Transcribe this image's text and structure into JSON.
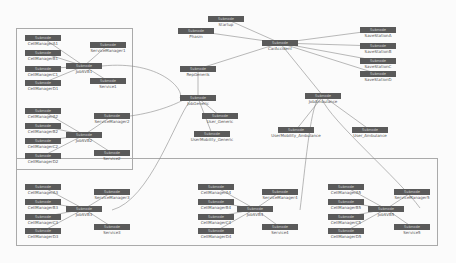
{
  "diagram": {
    "type_label": "Subnode",
    "nodes": [
      {
        "id": "phasm",
        "label": "Phasm",
        "x": 178,
        "y": 28,
        "w": 36
      },
      {
        "id": "startup",
        "label": "Startup",
        "x": 208,
        "y": 16,
        "w": 36
      },
      {
        "id": "caraccident",
        "label": "CarAccident",
        "x": 262,
        "y": 40,
        "w": 36
      },
      {
        "id": "ss_a",
        "label": "SaveStationA",
        "x": 360,
        "y": 27,
        "w": 36
      },
      {
        "id": "ss_b",
        "label": "SaveStationB",
        "x": 360,
        "y": 43,
        "w": 36
      },
      {
        "id": "ss_c",
        "label": "SaveStationC",
        "x": 360,
        "y": 58,
        "w": 36
      },
      {
        "id": "ss_d",
        "label": "SaveStationD",
        "x": 360,
        "y": 71,
        "w": 36
      },
      {
        "id": "repgenerisch",
        "label": "RepGenerik",
        "x": 180,
        "y": 66,
        "w": 36
      },
      {
        "id": "jobgeneric",
        "label": "JobGeneric",
        "x": 180,
        "y": 95,
        "w": 36
      },
      {
        "id": "user_generic",
        "label": "User_Generic",
        "x": 202,
        "y": 113,
        "w": 36
      },
      {
        "id": "usermob_generic",
        "label": "UserMobility_Generic",
        "x": 194,
        "y": 131,
        "w": 36
      },
      {
        "id": "jobambulance",
        "label": "JobAmbulance",
        "x": 305,
        "y": 93,
        "w": 36
      },
      {
        "id": "usermob_amb",
        "label": "UserMobility_Ambulance",
        "x": 278,
        "y": 127,
        "w": 36
      },
      {
        "id": "user_amb",
        "label": "User_Ambulance",
        "x": 352,
        "y": 127,
        "w": 36
      },
      {
        "id": "jobsvb1",
        "label": "JobSVB1",
        "x": 66,
        "y": 63,
        "w": 36
      },
      {
        "id": "servmgr1",
        "label": "ServiceManager1",
        "x": 90,
        "y": 42,
        "w": 36
      },
      {
        "id": "service1",
        "label": "Service1",
        "x": 90,
        "y": 78,
        "w": 36
      },
      {
        "id": "cm_a1",
        "label": "CellManagerA1",
        "x": 25,
        "y": 35,
        "w": 36
      },
      {
        "id": "cm_b1",
        "label": "CellManagerB1",
        "x": 25,
        "y": 50,
        "w": 36
      },
      {
        "id": "cm_c1",
        "label": "CellManagerC1",
        "x": 25,
        "y": 66,
        "w": 36
      },
      {
        "id": "cm_d1",
        "label": "CellManagerD1",
        "x": 25,
        "y": 80,
        "w": 36
      },
      {
        "id": "jobsvb2",
        "label": "JobSVB2",
        "x": 66,
        "y": 132,
        "w": 36
      },
      {
        "id": "servmgr2",
        "label": "ServiceManager2",
        "x": 94,
        "y": 113,
        "w": 36
      },
      {
        "id": "service2",
        "label": "Service2",
        "x": 94,
        "y": 150,
        "w": 36
      },
      {
        "id": "cm_a2",
        "label": "CellManagerA2",
        "x": 25,
        "y": 108,
        "w": 36
      },
      {
        "id": "cm_b2",
        "label": "CellManagerB2",
        "x": 25,
        "y": 123,
        "w": 36
      },
      {
        "id": "cm_c2",
        "label": "CellManagerC2",
        "x": 25,
        "y": 138,
        "w": 36
      },
      {
        "id": "cm_d2",
        "label": "CellManagerD2",
        "x": 25,
        "y": 153,
        "w": 36
      },
      {
        "id": "jobsvb3",
        "label": "JobSVB3",
        "x": 66,
        "y": 206,
        "w": 36
      },
      {
        "id": "servmgr3",
        "label": "ServiceManager3",
        "x": 94,
        "y": 189,
        "w": 36
      },
      {
        "id": "service3",
        "label": "Service3",
        "x": 94,
        "y": 224,
        "w": 36
      },
      {
        "id": "cm_a3",
        "label": "CellManagerA3",
        "x": 25,
        "y": 184,
        "w": 36
      },
      {
        "id": "cm_b3",
        "label": "CellManagerB3",
        "x": 25,
        "y": 199,
        "w": 36
      },
      {
        "id": "cm_c3",
        "label": "CellManagerC3",
        "x": 25,
        "y": 214,
        "w": 36
      },
      {
        "id": "cm_d3",
        "label": "CellManagerD3",
        "x": 25,
        "y": 228,
        "w": 36
      },
      {
        "id": "jobsvb4",
        "label": "JobSVB4",
        "x": 237,
        "y": 206,
        "w": 36
      },
      {
        "id": "servmgr4",
        "label": "ServiceManager4",
        "x": 262,
        "y": 189,
        "w": 36
      },
      {
        "id": "service4",
        "label": "Service4",
        "x": 262,
        "y": 224,
        "w": 36
      },
      {
        "id": "cm_a4",
        "label": "CellManagerA4",
        "x": 198,
        "y": 184,
        "w": 36
      },
      {
        "id": "cm_b4",
        "label": "CellManagerB4",
        "x": 198,
        "y": 199,
        "w": 36
      },
      {
        "id": "cm_c4",
        "label": "CellManagerC4",
        "x": 198,
        "y": 214,
        "w": 36
      },
      {
        "id": "cm_d4",
        "label": "CellManagerD4",
        "x": 198,
        "y": 228,
        "w": 36
      },
      {
        "id": "jobsvb5",
        "label": "JobSVB5",
        "x": 368,
        "y": 206,
        "w": 36
      },
      {
        "id": "servmgr5",
        "label": "ServiceManager5",
        "x": 394,
        "y": 189,
        "w": 36
      },
      {
        "id": "service5",
        "label": "Service5",
        "x": 394,
        "y": 224,
        "w": 36
      },
      {
        "id": "cm_a5",
        "label": "CellManagerA5",
        "x": 328,
        "y": 184,
        "w": 36
      },
      {
        "id": "cm_b5",
        "label": "CellManagerB5",
        "x": 328,
        "y": 199,
        "w": 36
      },
      {
        "id": "cm_c5",
        "label": "CellManagerC5",
        "x": 328,
        "y": 214,
        "w": 36
      },
      {
        "id": "cm_d5",
        "label": "CellManagerD5",
        "x": 328,
        "y": 228,
        "w": 36
      }
    ],
    "edges": [
      [
        "phasm",
        "caraccident"
      ],
      [
        "startup",
        "caraccident"
      ],
      [
        "caraccident",
        "ss_a"
      ],
      [
        "caraccident",
        "ss_b"
      ],
      [
        "caraccident",
        "ss_c"
      ],
      [
        "caraccident",
        "ss_d"
      ],
      [
        "caraccident",
        "repgenerisch"
      ],
      [
        "caraccident",
        "jobambulance"
      ],
      [
        "repgenerisch",
        "jobgeneric"
      ],
      [
        "jobgeneric",
        "user_generic"
      ],
      [
        "jobgeneric",
        "usermob_generic"
      ],
      [
        "jobambulance",
        "usermob_amb"
      ],
      [
        "jobambulance",
        "user_amb"
      ],
      [
        "jobsvb1",
        "servmgr1"
      ],
      [
        "jobsvb1",
        "service1"
      ],
      [
        "cm_a1",
        "jobsvb1"
      ],
      [
        "cm_b1",
        "jobsvb1"
      ],
      [
        "cm_c1",
        "jobsvb1"
      ],
      [
        "cm_d1",
        "jobsvb1"
      ],
      [
        "jobsvb2",
        "servmgr2"
      ],
      [
        "jobsvb2",
        "service2"
      ],
      [
        "cm_a2",
        "jobsvb2"
      ],
      [
        "cm_b2",
        "jobsvb2"
      ],
      [
        "cm_c2",
        "jobsvb2"
      ],
      [
        "cm_d2",
        "jobsvb2"
      ],
      [
        "jobsvb3",
        "servmgr3"
      ],
      [
        "jobsvb3",
        "service3"
      ],
      [
        "cm_a3",
        "jobsvb3"
      ],
      [
        "cm_b3",
        "jobsvb3"
      ],
      [
        "cm_c3",
        "jobsvb3"
      ],
      [
        "cm_d3",
        "jobsvb3"
      ],
      [
        "jobsvb4",
        "servmgr4"
      ],
      [
        "jobsvb4",
        "service4"
      ],
      [
        "cm_a4",
        "jobsvb4"
      ],
      [
        "cm_b4",
        "jobsvb4"
      ],
      [
        "cm_c4",
        "jobsvb4"
      ],
      [
        "cm_d4",
        "jobsvb4"
      ],
      [
        "jobsvb5",
        "servmgr5"
      ],
      [
        "jobsvb5",
        "service5"
      ],
      [
        "cm_a5",
        "jobsvb5"
      ],
      [
        "cm_b5",
        "jobsvb5"
      ],
      [
        "cm_c5",
        "jobsvb5"
      ],
      [
        "cm_d5",
        "jobsvb5"
      ]
    ],
    "curves": [
      "M102,66 C160,60 185,90 180,98",
      "M130,116 C160,112 180,102 185,99",
      "M112,210 C150,200 175,120 190,101",
      "M300,210 C305,170 310,110 318,99",
      "M420,208 C400,180 330,120 322,99"
    ],
    "clusters": [
      {
        "name": "cluster-top-left",
        "x": 16,
        "y": 28,
        "w": 115,
        "h": 140
      },
      {
        "name": "cluster-bottom",
        "x": 16,
        "y": 158,
        "w": 420,
        "h": 86
      }
    ]
  }
}
